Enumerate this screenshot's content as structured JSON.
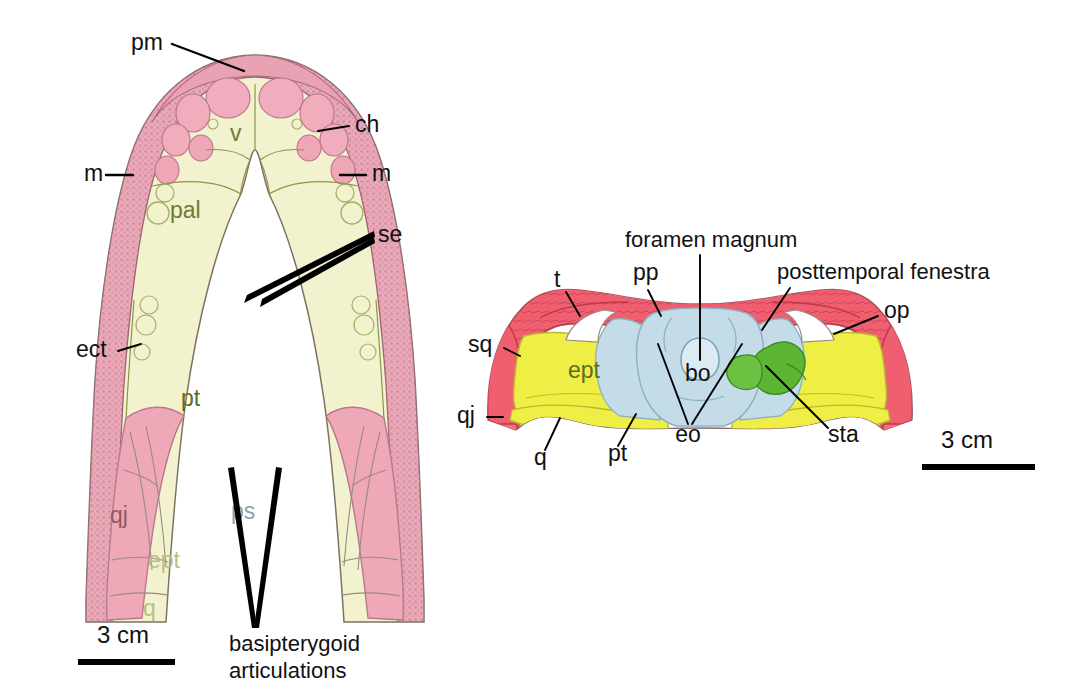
{
  "figure": {
    "caption_present": false,
    "panels": [
      {
        "id": "palate",
        "name": "palatal-view",
        "scale_bar": {
          "label": "3 cm",
          "x1": 78,
          "x2": 175,
          "y": 662
        }
      },
      {
        "id": "occiput",
        "name": "occipital-view",
        "scale_bar": {
          "label": "3 cm",
          "x1": 922,
          "x2": 1035,
          "y": 467
        }
      }
    ]
  },
  "palate_labels": [
    {
      "key": "pm",
      "text": "pm",
      "x": 131,
      "y": 44,
      "anchor": "start",
      "style": "lbl"
    },
    {
      "key": "ch",
      "text": "ch",
      "x": 355,
      "y": 126,
      "anchor": "start",
      "style": "lbl"
    },
    {
      "key": "m_left",
      "text": "m",
      "x": 84,
      "y": 175,
      "anchor": "start",
      "style": "lbl"
    },
    {
      "key": "m_right",
      "text": "m",
      "x": 372,
      "y": 175,
      "anchor": "start",
      "style": "lbl"
    },
    {
      "key": "se",
      "text": "se",
      "x": 378,
      "y": 236,
      "anchor": "start",
      "style": "lbl"
    },
    {
      "key": "ect",
      "text": "ect",
      "x": 76,
      "y": 351,
      "anchor": "start",
      "style": "lbl"
    },
    {
      "key": "basipterygoid_1",
      "text": "basipterygoid",
      "x": 229,
      "y": 645,
      "anchor": "start",
      "style": "lbl-long"
    },
    {
      "key": "basipterygoid_2",
      "text": "articulations",
      "x": 229,
      "y": 672,
      "anchor": "start",
      "style": "lbl-long"
    }
  ],
  "palate_inset_labels": [
    {
      "key": "v",
      "text": "v",
      "x": 230,
      "y": 135,
      "style": "lbl-inset"
    },
    {
      "key": "pal",
      "text": "pal",
      "x": 170,
      "y": 212,
      "style": "lbl-inset"
    },
    {
      "key": "pt",
      "text": "pt",
      "x": 181,
      "y": 400,
      "style": "lbl-dark-olive"
    },
    {
      "key": "qj",
      "text": "qj",
      "x": 110,
      "y": 517,
      "style": "lbl-inset-rose"
    },
    {
      "key": "ps",
      "text": "ps",
      "x": 231,
      "y": 513,
      "style": "lbl-inset-grey"
    },
    {
      "key": "ept",
      "text": "ept",
      "x": 148,
      "y": 562,
      "style": "lbl-inset-faint"
    },
    {
      "key": "q",
      "text": "q",
      "x": 143,
      "y": 610,
      "style": "lbl-inset-faint"
    }
  ],
  "occiput_labels": [
    {
      "key": "foramen_magnum",
      "text": "foramen magnum",
      "x": 625,
      "y": 241,
      "anchor": "start",
      "style": "lbl-long"
    },
    {
      "key": "posttemporal_fenestra",
      "text": "posttemporal fenestra",
      "x": 777,
      "y": 273,
      "anchor": "start",
      "style": "lbl-long"
    },
    {
      "key": "t",
      "text": "t",
      "x": 554,
      "y": 281,
      "anchor": "start",
      "style": "lbl"
    },
    {
      "key": "pp",
      "text": "pp",
      "x": 633,
      "y": 274,
      "anchor": "start",
      "style": "lbl"
    },
    {
      "key": "op",
      "text": "op",
      "x": 884,
      "y": 312,
      "anchor": "start",
      "style": "lbl"
    },
    {
      "key": "sq",
      "text": "sq",
      "x": 468,
      "y": 346,
      "anchor": "start",
      "style": "lbl"
    },
    {
      "key": "qj",
      "text": "qj",
      "x": 457,
      "y": 417,
      "anchor": "start",
      "style": "lbl"
    },
    {
      "key": "q",
      "text": "q",
      "x": 534,
      "y": 459,
      "anchor": "start",
      "style": "lbl"
    },
    {
      "key": "pt",
      "text": "pt",
      "x": 608,
      "y": 455,
      "anchor": "start",
      "style": "lbl"
    },
    {
      "key": "eo",
      "text": "eo",
      "x": 688,
      "y": 436,
      "anchor": "middle",
      "style": "lbl"
    },
    {
      "key": "sta",
      "text": "sta",
      "x": 828,
      "y": 436,
      "anchor": "start",
      "style": "lbl"
    }
  ],
  "occiput_inset_labels": [
    {
      "key": "ept",
      "text": "ept",
      "x": 568,
      "y": 372,
      "style": "lbl-dark-olive"
    },
    {
      "key": "bo",
      "text": "bo",
      "x": 685,
      "y": 375,
      "style": "lbl"
    }
  ],
  "colors": {
    "palate_pink": "#f0b8c4",
    "palate_pink_deep": "#eda9b8",
    "palate_cream": "#f3f2ce",
    "palate_olive": "#d6dc9a",
    "palate_blue": "#d9e7ed",
    "occiput_red": "#ef5f6f",
    "occiput_yellow": "#eeee44",
    "occiput_blue": "#c4dce8",
    "occiput_green": "#5cb533",
    "outline": "#6a5a52",
    "label_text": "#111111"
  }
}
